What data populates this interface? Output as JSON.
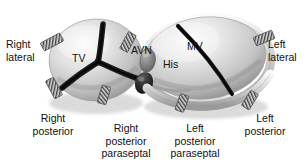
{
  "figure": {
    "type": "anatomical-diagram",
    "style": "grayscale-airbrush-illustration",
    "colors": {
      "background": "#ffffff",
      "annulus_light": "#e9e9e9",
      "annulus_mid": "#bdbdbd",
      "annulus_shadow": "#8d8d8d",
      "leaflet_dark": "#1d1d1d",
      "node_gray": "#707070",
      "marker_hatch": "#4a4a4a",
      "text": "#111111"
    }
  },
  "structures": {
    "tricuspid_valve": {
      "label": "TV",
      "full_name": "tricuspid valve",
      "leaflets": 3
    },
    "mitral_valve": {
      "label": "MV",
      "full_name": "mitral valve",
      "leaflets": 2
    },
    "av_node": {
      "label": "AVN",
      "full_name": "atrioventricular node"
    },
    "his_bundle": {
      "label": "His",
      "full_name": "bundle of His"
    }
  },
  "site_labels": [
    {
      "id": "right-lateral",
      "lines": [
        "Right",
        "lateral"
      ]
    },
    {
      "id": "left-lateral",
      "lines": [
        "Left",
        "lateral"
      ]
    },
    {
      "id": "right-posterior",
      "lines": [
        "Right",
        "posterior"
      ]
    },
    {
      "id": "right-posterior-paraseptal",
      "lines": [
        "Right",
        "posterior",
        "paraseptal"
      ]
    },
    {
      "id": "left-posterior-paraseptal",
      "lines": [
        "Left",
        "posterior",
        "paraseptal"
      ]
    },
    {
      "id": "left-posterior",
      "lines": [
        "Left",
        "posterior"
      ]
    }
  ],
  "ablation_markers": [
    {
      "id": "marker-right-lateral-upper",
      "site": "right lateral"
    },
    {
      "id": "marker-right-posterior",
      "site": "right posterior"
    },
    {
      "id": "marker-right-post-paraseptal",
      "site": "right posterior paraseptal"
    },
    {
      "id": "marker-anteroseptal",
      "site": "near AV node"
    },
    {
      "id": "marker-left-post-paraseptal",
      "site": "left posterior paraseptal"
    },
    {
      "id": "marker-left-posterior",
      "site": "left posterior"
    },
    {
      "id": "marker-left-lateral",
      "site": "left lateral"
    }
  ]
}
